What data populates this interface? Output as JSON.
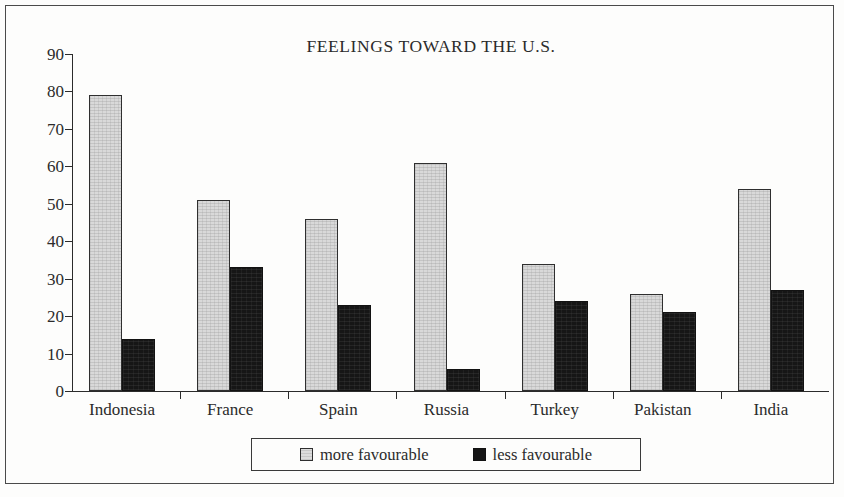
{
  "chart_data": {
    "type": "bar",
    "title": "FEELINGS TOWARD THE U.S.",
    "xlabel": "",
    "ylabel": "",
    "ylim": [
      0,
      90
    ],
    "yticks": [
      0,
      10,
      20,
      30,
      40,
      50,
      60,
      70,
      80,
      90
    ],
    "grid": false,
    "legend_position": "bottom-center",
    "categories": [
      "Indonesia",
      "France",
      "Spain",
      "Russia",
      "Turkey",
      "Pakistan",
      "India"
    ],
    "series": [
      {
        "name": "more favourable",
        "color": "#d9d9d9",
        "values": [
          79,
          51,
          46,
          61,
          34,
          26,
          54
        ]
      },
      {
        "name": "less favourable",
        "color": "#161616",
        "values": [
          14,
          33,
          23,
          6,
          24,
          21,
          27
        ]
      }
    ]
  },
  "legend": {
    "items": [
      {
        "label": "more favourable",
        "swatch": "light-square-swatch"
      },
      {
        "label": "less favourable",
        "swatch": "dark-square-swatch"
      }
    ]
  }
}
